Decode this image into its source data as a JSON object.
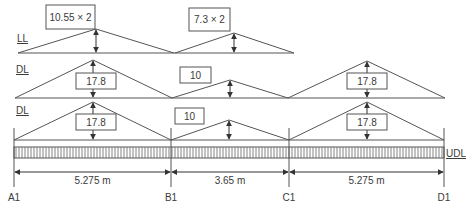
{
  "rows": [
    {
      "label": "LL",
      "label_pos": [
        17,
        42
      ],
      "baseline_y": 53,
      "triangles": [
        {
          "x0": 18,
          "x1": 174,
          "peak_x": 96,
          "peak_y": 29,
          "value": "10.55 × 2",
          "box": [
            46,
            5,
            49,
            24
          ]
        },
        {
          "x0": 175,
          "x1": 294,
          "peak_x": 234,
          "peak_y": 33,
          "value": "7.3 × 2",
          "box": [
            189,
            8,
            41,
            23
          ]
        }
      ]
    },
    {
      "label": "DL",
      "label_pos": [
        16,
        73
      ],
      "baseline_y": 98,
      "triangles": [
        {
          "x0": 15,
          "x1": 172,
          "peak_x": 93,
          "peak_y": 60,
          "value": "17.8",
          "box": [
            76,
            73,
            40,
            16
          ]
        },
        {
          "x0": 172,
          "x1": 288,
          "peak_x": 230,
          "peak_y": 80,
          "value": "10",
          "box": [
            180,
            67,
            31,
            16
          ]
        },
        {
          "x0": 288,
          "x1": 445,
          "peak_x": 367,
          "peak_y": 61,
          "value": "17.8",
          "box": [
            347,
            73,
            40,
            16
          ]
        }
      ]
    },
    {
      "label": "DL",
      "label_pos": [
        16,
        114
      ],
      "baseline_y": 140,
      "triangles": [
        {
          "x0": 14,
          "x1": 171,
          "peak_x": 93,
          "peak_y": 102,
          "value": "17.8",
          "box": [
            76,
            114,
            40,
            16
          ]
        },
        {
          "x0": 171,
          "x1": 289,
          "peak_x": 229,
          "peak_y": 120,
          "value": "10",
          "box": [
            175,
            108,
            29,
            16
          ]
        },
        {
          "x0": 289,
          "x1": 444,
          "peak_x": 367,
          "peak_y": 102,
          "value": "17.8",
          "box": [
            347,
            114,
            40,
            16
          ]
        }
      ]
    }
  ],
  "beam": {
    "label": "UDL",
    "y_top": 147,
    "y_bottom": 158,
    "x_start": 14,
    "x_end": 444
  },
  "supports": [
    {
      "label": "A1",
      "x": 14
    },
    {
      "label": "B1",
      "x": 171
    },
    {
      "label": "C1",
      "x": 289
    },
    {
      "label": "D1",
      "x": 444
    }
  ],
  "spans": [
    {
      "label": "5.275 m",
      "from": 14,
      "to": 171
    },
    {
      "label": "3.65 m",
      "from": 171,
      "to": 289
    },
    {
      "label": "5.275 m",
      "from": 289,
      "to": 444
    }
  ],
  "colors": {
    "line": "#555555",
    "text": "#3a3a3a"
  }
}
